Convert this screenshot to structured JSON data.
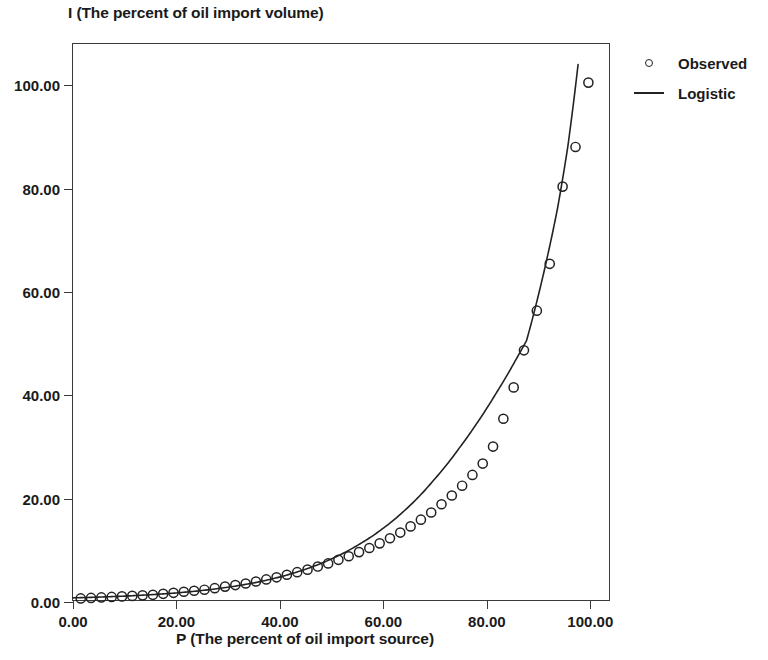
{
  "chart_data": {
    "type": "scatter",
    "title": "",
    "xlabel": "P (The percent of oil import source)",
    "ylabel": "I (The percent of oil import volume)",
    "xlim": [
      0,
      104
    ],
    "ylim": [
      0,
      108
    ],
    "grid": false,
    "legend_position": "right",
    "xticks": [
      "0.00",
      "20.00",
      "40.00",
      "60.00",
      "80.00",
      "100.00"
    ],
    "xtick_values": [
      0,
      20,
      40,
      60,
      80,
      100
    ],
    "yticks": [
      "0.00",
      "20.00",
      "40.00",
      "60.00",
      "80.00",
      "100.00"
    ],
    "ytick_values": [
      0,
      20,
      40,
      60,
      80,
      100
    ],
    "series": [
      {
        "name": "Observed",
        "marker": "open-circle",
        "type": "scatter",
        "color": "#222222",
        "x": [
          1.5,
          3.5,
          5.5,
          7.5,
          9.5,
          11.5,
          13.5,
          15.5,
          17.5,
          19.5,
          21.5,
          23.5,
          25.5,
          27.5,
          29.5,
          31.5,
          33.5,
          35.5,
          37.5,
          39.5,
          41.5,
          43.5,
          45.5,
          47.5,
          49.5,
          51.5,
          53.5,
          55.5,
          57.5,
          59.5,
          61.5,
          63.5,
          65.5,
          67.5,
          69.5,
          71.5,
          73.5,
          75.5,
          77.5,
          79.5,
          81.5,
          83.5,
          85.5,
          87.5,
          90.0,
          92.5,
          95.0,
          97.5,
          100.0
        ],
        "y": [
          0.3,
          0.4,
          0.5,
          0.6,
          0.7,
          0.8,
          0.9,
          1.0,
          1.2,
          1.4,
          1.6,
          1.8,
          2.0,
          2.3,
          2.6,
          2.9,
          3.2,
          3.6,
          4.0,
          4.4,
          4.9,
          5.4,
          5.9,
          6.5,
          7.1,
          7.8,
          8.5,
          9.3,
          10.1,
          11.0,
          12.0,
          13.1,
          14.3,
          15.6,
          17.0,
          18.6,
          20.3,
          22.2,
          24.3,
          26.5,
          29.8,
          35.2,
          41.3,
          48.5,
          56.2,
          65.3,
          80.3,
          88.0,
          100.5
        ]
      },
      {
        "name": "Logistic",
        "marker": "none",
        "type": "line",
        "color": "#222222",
        "x": [
          0,
          5,
          10,
          15,
          20,
          25,
          30,
          35,
          40,
          45,
          50,
          55,
          60,
          65,
          70,
          75,
          78,
          80,
          82,
          84,
          86,
          88,
          90,
          92,
          94,
          96,
          98
        ],
        "y": [
          0.42,
          0.56,
          0.76,
          1.02,
          1.37,
          1.84,
          2.47,
          3.31,
          4.44,
          5.94,
          7.92,
          10.5,
          13.8,
          18.0,
          23.3,
          29.6,
          33.8,
          36.8,
          40.0,
          43.3,
          46.8,
          50.4,
          58.0,
          66.5,
          76.0,
          88.0,
          104.0
        ]
      }
    ]
  },
  "legend": {
    "items": [
      {
        "label": "Observed",
        "key": "circle-marker"
      },
      {
        "label": "Logistic",
        "key": "line-marker"
      }
    ]
  }
}
